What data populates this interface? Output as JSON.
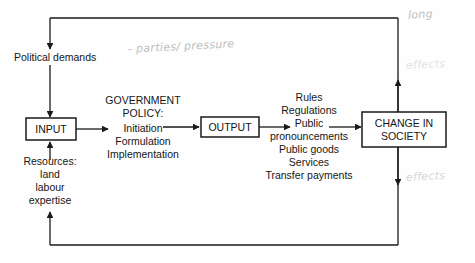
{
  "diagram": {
    "nodes": {
      "political_demands": "Political demands",
      "input_box": "INPUT",
      "output_box": "OUTPUT",
      "change_box": "CHANGE IN\nSOCIETY",
      "government_policy_heading": "GOVERNMENT\nPOLICY:",
      "government_policy_items": "Initiation\nFormulation\nImplementation",
      "resources_heading": "Resources:",
      "resources_items": "land\nlabour\nexpertise",
      "outputs_list": "Rules\nRegulations\nPublic\npronouncements\nPublic goods\nServices\nTransfer payments"
    },
    "annotations": {
      "parties_pressure": "- parties/ pressure",
      "long": "long",
      "effects_upper": "effects",
      "effects_lower": "effects"
    },
    "colors": {
      "line": "#1a1a1a",
      "text": "#161616",
      "handwriting": "#bfbfbf",
      "background": "#fefefe"
    }
  }
}
